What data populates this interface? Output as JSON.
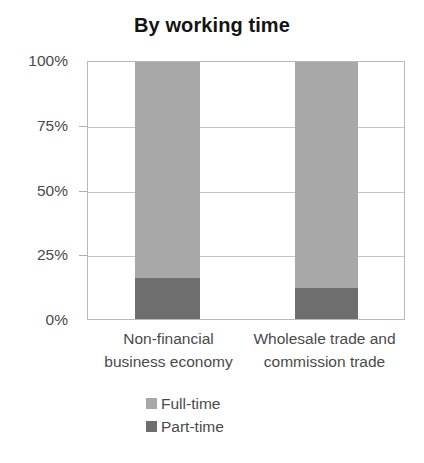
{
  "chart_data": {
    "type": "bar",
    "subtype": "100-percent-stacked-vertical",
    "title": "By working time",
    "xlabel": "",
    "ylabel": "",
    "grid": true,
    "legend_position": "bottom",
    "ylim": [
      0,
      100
    ],
    "yticks": [
      {
        "value": 100,
        "label": "100%"
      },
      {
        "value": 75,
        "label": "75%"
      },
      {
        "value": 50,
        "label": "50%"
      },
      {
        "value": 25,
        "label": "25%"
      },
      {
        "value": 0,
        "label": "0%"
      }
    ],
    "categories": [
      "Non-financial business economy",
      "Wholesale trade and commission trade"
    ],
    "category_label_lines": [
      [
        "Non-financial",
        "business economy"
      ],
      [
        "Wholesale trade and",
        "commission trade"
      ]
    ],
    "series": [
      {
        "name": "Full-time",
        "color": "#a8a8a8",
        "values": [
          84,
          88
        ]
      },
      {
        "name": "Part-time",
        "color": "#6e6e6e",
        "values": [
          16,
          12
        ]
      }
    ],
    "stack_order_bottom_to_top": [
      "Part-time",
      "Full-time"
    ]
  },
  "legend": {
    "entries": [
      {
        "label": "Full-time",
        "color": "#a8a8a8"
      },
      {
        "label": "Part-time",
        "color": "#6e6e6e"
      }
    ]
  },
  "colors": {
    "full_time": "#a8a8a8",
    "part_time": "#6e6e6e",
    "axis": "#b9b9b9",
    "gridline": "#c3c3c3",
    "title_text": "#141414",
    "tick_text": "#4a4a4a",
    "background": "#ffffff"
  }
}
